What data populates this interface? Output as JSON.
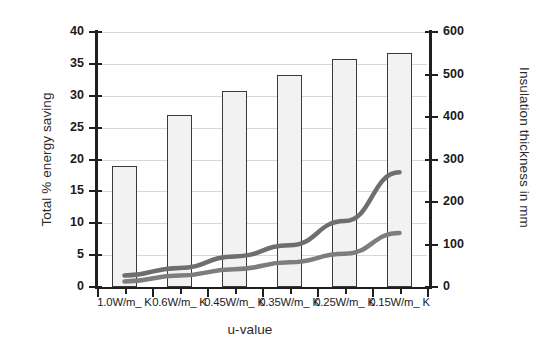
{
  "chart_data": {
    "type": "bar",
    "title": "",
    "subtitle": "",
    "xlabel": "u-value",
    "ylabel": "Total % energy saving",
    "ylabel_secondary": "Insulation thickness in mm",
    "categories": [
      "1.0W/m_ K",
      "0.6W/m_ K",
      "0.45W/m_ K",
      "0.35W/m_ K",
      "0.25W/m_ K",
      "0.15W/m_ K"
    ],
    "ylim": [
      0,
      40
    ],
    "yticks": [
      0,
      5,
      10,
      15,
      20,
      25,
      30,
      35,
      40
    ],
    "ylim_secondary": [
      0,
      600
    ],
    "yticks_secondary": [
      0,
      100,
      200,
      300,
      400,
      500,
      600
    ],
    "grid": true,
    "legend": "none",
    "series": [
      {
        "name": "Total % energy saving",
        "type": "bar",
        "axis": "left",
        "values": [
          19.0,
          27.0,
          30.7,
          33.2,
          35.7,
          36.7
        ],
        "fill_color": "#f2f2f2",
        "edge_color": "#3a3a3a"
      },
      {
        "name": "Insulation thickness upper",
        "type": "line",
        "axis": "right",
        "values": [
          27,
          45,
          72,
          98,
          155,
          270
        ],
        "color": "#6e6e6e"
      },
      {
        "name": "Insulation thickness lower",
        "type": "line",
        "axis": "right",
        "values": [
          13,
          27,
          42,
          58,
          78,
          127
        ],
        "color": "#7d7d7d"
      }
    ]
  },
  "axis_left": {
    "labels": [
      "40",
      "35",
      "30",
      "25",
      "20",
      "15",
      "10",
      "5",
      "0"
    ]
  },
  "axis_right": {
    "labels": [
      "600",
      "500",
      "400",
      "300",
      "200",
      "100",
      "0"
    ]
  },
  "colors": {
    "background": "#ffffff",
    "axis": "#1f1f1f",
    "grid": "#d8d8d8",
    "bar_fill": "#f2f2f2",
    "bar_edge": "#3a3a3a",
    "line_upper": "#6e6e6e",
    "line_lower": "#7d7d7d",
    "text": "#1a1a1a"
  }
}
